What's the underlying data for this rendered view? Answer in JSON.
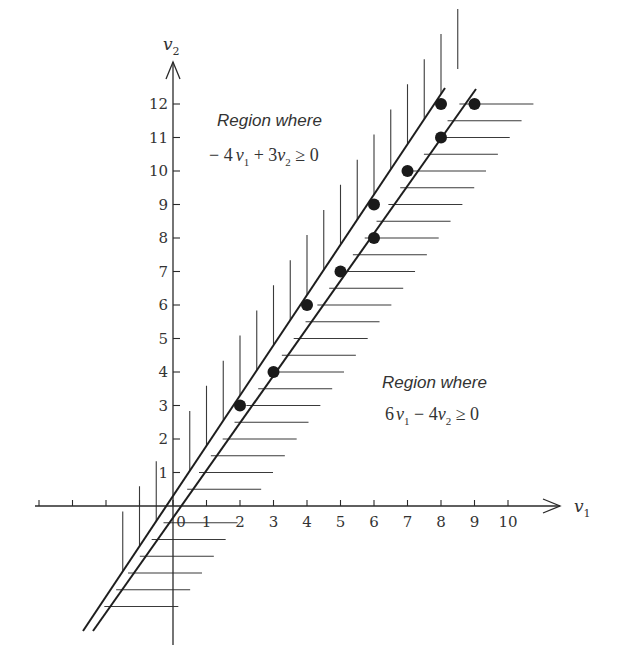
{
  "chart_data": {
    "type": "scatter",
    "title": "",
    "xlabel": "v1",
    "ylabel": "v2",
    "xlim": [
      -4,
      10
    ],
    "ylim": [
      -4,
      12
    ],
    "grid": false,
    "x_ticks": [
      -4,
      -3,
      -2,
      -1,
      0,
      1,
      2,
      3,
      4,
      5,
      6,
      7,
      8,
      9,
      10
    ],
    "x_tick_labels": [
      "0",
      "1",
      "2",
      "3",
      "4",
      "5",
      "6",
      "7",
      "8",
      "9",
      "10"
    ],
    "y_ticks": [
      1,
      2,
      3,
      4,
      5,
      6,
      7,
      8,
      9,
      10,
      11,
      12
    ],
    "y_tick_labels": [
      "1",
      "2",
      "3",
      "4",
      "5",
      "6",
      "7",
      "8",
      "9",
      "10",
      "11",
      "12"
    ],
    "points": [
      {
        "v1": 2,
        "v2": 3
      },
      {
        "v1": 3,
        "v2": 4
      },
      {
        "v1": 4,
        "v2": 6
      },
      {
        "v1": 5,
        "v2": 7
      },
      {
        "v1": 6,
        "v2": 8
      },
      {
        "v1": 6,
        "v2": 9
      },
      {
        "v1": 7,
        "v2": 10
      },
      {
        "v1": 8,
        "v2": 11
      },
      {
        "v1": 8,
        "v2": 12
      },
      {
        "v1": 9,
        "v2": 12
      }
    ],
    "boundary_lines": [
      {
        "name": "6v1 - 4v2 = 0",
        "slope": 1.5,
        "hatch_side": "upper-left (vertical hatching)"
      },
      {
        "name": "-4v1 + 3v2 = 0",
        "slope": 1.3333,
        "hatch_side": "lower-right (horizontal hatching)"
      }
    ],
    "annotations": [
      {
        "title": "Region where",
        "expression": "−4v1 + 3v2 ≥ 0",
        "position": "upper-left"
      },
      {
        "title": "Region where",
        "expression": "6v1 − 4v2 ≥ 0",
        "position": "lower-right"
      }
    ]
  },
  "labels": {
    "x_axis": "v",
    "x_axis_sub": "1",
    "y_axis": "v",
    "y_axis_sub": "2",
    "region_upper_title": "Region where",
    "region_upper_expr_a": "− 4",
    "region_upper_expr_v1": "v",
    "region_upper_expr_s1": "1",
    "region_upper_expr_b": " + 3",
    "region_upper_expr_v2": "v",
    "region_upper_expr_s2": "2",
    "region_upper_expr_c": " ≥ 0",
    "region_lower_title": "Region where",
    "region_lower_expr_a": "6",
    "region_lower_expr_v1": "v",
    "region_lower_expr_s1": "1",
    "region_lower_expr_b": " − 4",
    "region_lower_expr_v2": "v",
    "region_lower_expr_s2": "2",
    "region_lower_expr_c": " ≥ 0"
  },
  "geometry": {
    "origin": [
      173,
      506
    ],
    "unit": 33.5,
    "line_a": [
      [
        83,
        631
      ],
      [
        445,
        88
      ]
    ],
    "line_b": [
      [
        93,
        631
      ],
      [
        476,
        89
      ]
    ]
  }
}
